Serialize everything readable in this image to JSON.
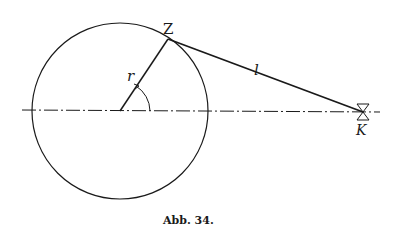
{
  "figure": {
    "caption": "Abb. 34.",
    "labels": {
      "crank_point": "Z",
      "radius": "r",
      "rod_length": "l",
      "crosshead": "K"
    },
    "colors": {
      "stroke": "#1a1a1a",
      "background": "#ffffff"
    }
  }
}
